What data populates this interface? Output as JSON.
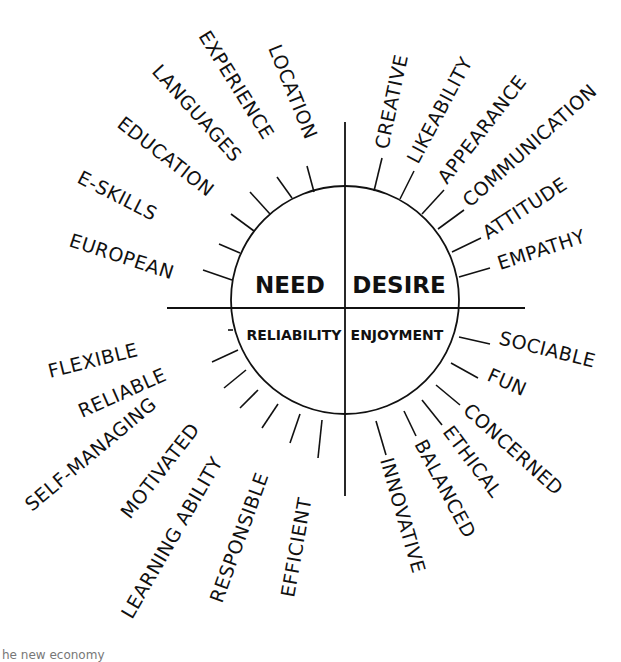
{
  "diagram": {
    "quadrants": {
      "top_left": "NEED",
      "top_right": "DESIRE",
      "bottom_left": "RELIABILITY",
      "bottom_right": "ENJOYMENT"
    },
    "need_labels": [
      "EUROPEAN",
      "E-SKILLS",
      "EDUCATION",
      "LANGUAGES",
      "EXPERIENCE",
      "LOCATION"
    ],
    "desire_labels": [
      "CREATIVE",
      "LIKEABILITY",
      "APPEARANCE",
      "COMMUNICATION",
      "ATTITUDE",
      "EMPATHY"
    ],
    "reliability_labels": [
      "FLEXIBLE",
      "RELIABLE",
      "SELF-MANAGING",
      "MOTIVATED",
      "LEARNING ABILITY",
      "RESPONSIBLE",
      "EFFICIENT"
    ],
    "enjoyment_labels": [
      "SOCIABLE",
      "FUN",
      "CONCERNED",
      "ETHICAL",
      "BALANCED",
      "INNOVATIVE"
    ]
  },
  "caption": "he new economy",
  "colors": {
    "ink": "#111111",
    "background": "#ffffff"
  }
}
